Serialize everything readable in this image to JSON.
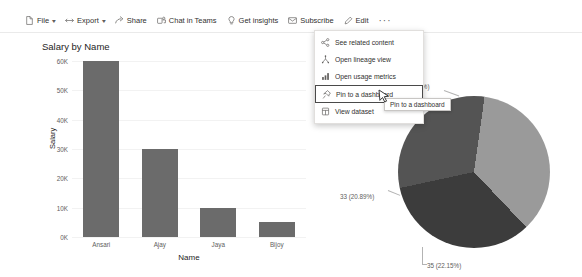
{
  "toolbar": {
    "items": [
      {
        "label": "File",
        "icon": "file-icon",
        "chevron": true
      },
      {
        "label": "Export",
        "icon": "export-icon",
        "chevron": true
      },
      {
        "label": "Share",
        "icon": "share-icon",
        "chevron": false
      },
      {
        "label": "Chat in Teams",
        "icon": "teams-icon",
        "chevron": false
      },
      {
        "label": "Get insights",
        "icon": "lightbulb-icon",
        "chevron": false
      },
      {
        "label": "Subscribe",
        "icon": "envelope-icon",
        "chevron": false
      },
      {
        "label": "Edit",
        "icon": "pencil-icon",
        "chevron": false
      }
    ],
    "overflow_label": "···"
  },
  "menu": {
    "items": [
      {
        "label": "See related content",
        "icon": "share-network-icon",
        "selected": false
      },
      {
        "label": "Open lineage view",
        "icon": "lineage-icon",
        "selected": false
      },
      {
        "label": "Open usage metrics",
        "icon": "bar-chart-icon",
        "selected": false
      },
      {
        "label": "Pin to a dashboard",
        "icon": "pin-icon",
        "selected": true
      },
      {
        "label": "View dataset",
        "icon": "dataset-icon",
        "selected": false
      }
    ]
  },
  "tooltip": {
    "text": "Pin to a dashboard"
  },
  "chart_data": [
    {
      "type": "bar",
      "title": "Salary by Name",
      "xlabel": "Name",
      "ylabel": "Salary",
      "categories": [
        "Ansari",
        "Ajay",
        "Jaya",
        "Bijoy"
      ],
      "values": [
        60000,
        30000,
        10000,
        5000
      ],
      "ylim": [
        0,
        60000
      ],
      "yticks": [
        0,
        10000,
        20000,
        30000,
        40000,
        50000,
        60000
      ],
      "ytick_labels": [
        "0K",
        "10K",
        "20K",
        "30K",
        "40K",
        "50K",
        "60K"
      ],
      "grid": true,
      "bar_color": "#6b6b6b",
      "legend": "none"
    },
    {
      "type": "pie",
      "title": "",
      "labels": [
        "35 (22.15%)",
        "33 (20.89%)",
        "(18.99%)"
      ],
      "values": [
        22.15,
        20.89,
        18.99
      ],
      "colors": [
        "#9a9a9a",
        "#3c3c3c",
        "#545454"
      ],
      "legend": "none",
      "annotations": [
        {
          "text": "33 (20.89%)",
          "position": "left"
        },
        {
          "text": "35 (22.15%)",
          "position": "bottom-right"
        },
        {
          "text": "(18.99%)",
          "position": "top-right"
        }
      ]
    }
  ]
}
